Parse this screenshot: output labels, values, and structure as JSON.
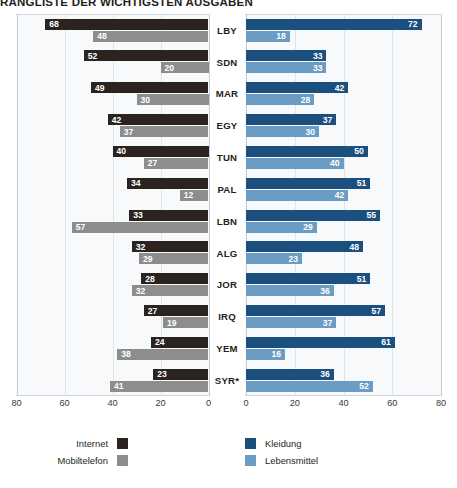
{
  "chart_data": {
    "type": "bar",
    "title": "RANGLISTE DER WICHTIGSTEN AUSGABEN",
    "orientation": "horizontal-diverging",
    "categories": [
      "LBY",
      "SDN",
      "MAR",
      "EGY",
      "TUN",
      "PAL",
      "LBN",
      "ALG",
      "JOR",
      "IRQ",
      "YEM",
      "SYR*"
    ],
    "series": [
      {
        "name": "Internet",
        "side": "left",
        "color": "#2b2320",
        "values": [
          68,
          52,
          49,
          42,
          40,
          34,
          33,
          32,
          28,
          27,
          24,
          23
        ]
      },
      {
        "name": "Mobiltelefon",
        "side": "left",
        "color": "#8d8d8d",
        "values": [
          48,
          20,
          30,
          37,
          27,
          12,
          57,
          29,
          32,
          19,
          38,
          41
        ]
      },
      {
        "name": "Kleidung",
        "side": "right",
        "color": "#1b4f7e",
        "values": [
          72,
          33,
          42,
          37,
          50,
          51,
          55,
          48,
          51,
          57,
          61,
          36
        ]
      },
      {
        "name": "Lebensmittel",
        "side": "right",
        "color": "#6b9cc4",
        "values": [
          18,
          33,
          28,
          30,
          40,
          42,
          29,
          23,
          36,
          37,
          16,
          52
        ]
      }
    ],
    "xlabel": "",
    "ylabel": "",
    "xlim_left": [
      80,
      0
    ],
    "xlim_right": [
      0,
      80
    ],
    "ticks_left": [
      "80",
      "60",
      "40",
      "20",
      "0"
    ],
    "ticks_right": [
      "0",
      "20",
      "40",
      "60",
      "80"
    ],
    "grid": true,
    "legend_position": "bottom"
  },
  "legend": {
    "items": [
      {
        "label": "Internet",
        "swatch": "internet"
      },
      {
        "label": "Mobiltelefon",
        "swatch": "mobil"
      },
      {
        "label": "Kleidung",
        "swatch": "kleidung"
      },
      {
        "label": "Lebensmittel",
        "swatch": "lebensmittel"
      }
    ]
  }
}
